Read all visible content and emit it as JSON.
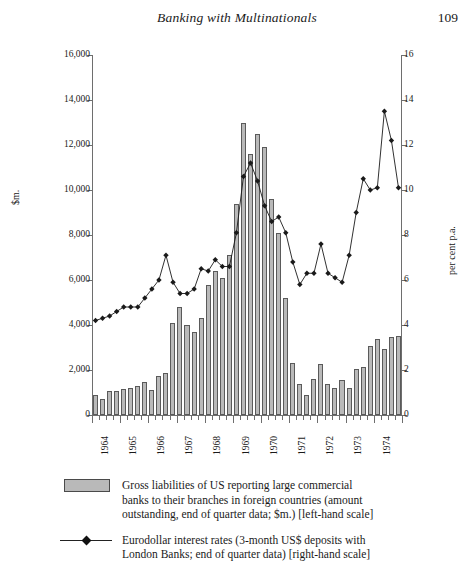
{
  "runhead": {
    "title": "Banking with Multinationals",
    "folio": "109"
  },
  "chart_data": {
    "type": "bar",
    "title": "",
    "xlabel": "",
    "ylabel": "$m.",
    "y2label": "per cent p.a.",
    "ylim": [
      0,
      16000
    ],
    "y2lim": [
      0,
      16
    ],
    "grid": false,
    "legend_position": "below",
    "y_ticks": [
      "0",
      "2,000",
      "4,000",
      "6,000",
      "8,000",
      "10,000",
      "12,000",
      "14,000",
      "16,000"
    ],
    "y_tick_values": [
      0,
      2000,
      4000,
      6000,
      8000,
      10000,
      12000,
      14000,
      16000
    ],
    "y2_ticks": [
      "0",
      "2",
      "4",
      "6",
      "8",
      "10",
      "12",
      "14",
      "16"
    ],
    "y2_tick_values": [
      0,
      2,
      4,
      6,
      8,
      10,
      12,
      14,
      16
    ],
    "x_tick_labels": [
      "1964",
      "1965",
      "1966",
      "1967",
      "1968",
      "1969",
      "1970",
      "1971",
      "1972",
      "1973",
      "1974"
    ],
    "x_periods": [
      "1964Q1",
      "1964Q2",
      "1964Q3",
      "1964Q4",
      "1965Q1",
      "1965Q2",
      "1965Q3",
      "1965Q4",
      "1966Q1",
      "1966Q2",
      "1966Q3",
      "1966Q4",
      "1967Q1",
      "1967Q2",
      "1967Q3",
      "1967Q4",
      "1968Q1",
      "1968Q2",
      "1968Q3",
      "1968Q4",
      "1969Q1",
      "1969Q2",
      "1969Q3",
      "1969Q4",
      "1970Q1",
      "1970Q2",
      "1970Q3",
      "1970Q4",
      "1971Q1",
      "1971Q2",
      "1971Q3",
      "1971Q4",
      "1972Q1",
      "1972Q2",
      "1972Q3",
      "1972Q4",
      "1973Q1",
      "1973Q2",
      "1973Q3",
      "1973Q4",
      "1974Q1",
      "1974Q2",
      "1974Q3",
      "1974Q4"
    ],
    "series": [
      {
        "name": "Gross liabilities of US reporting large commercial banks to their branches in foreign countries (amount outstanding, end of quarter data; $m.) [left-hand scale]",
        "type": "bar",
        "axis": "left",
        "color": "#b9b9b9",
        "values": [
          900,
          700,
          1050,
          1050,
          1150,
          1200,
          1300,
          1450,
          1100,
          1750,
          1850,
          4100,
          4800,
          4000,
          3700,
          4300,
          5800,
          6400,
          6100,
          7100,
          9400,
          13000,
          11600,
          12500,
          11900,
          9600,
          8100,
          5200,
          2300,
          1400,
          900,
          1600,
          2250,
          1400,
          1200,
          1550,
          1200,
          2050,
          2150,
          3050,
          3400,
          2950,
          3450,
          3500
        ]
      },
      {
        "name": "Eurodollar interest rates (3-month US$ deposits with London Banks; end of quarter data) [right-hand scale]",
        "type": "line",
        "axis": "right",
        "color": "#1a1a1a",
        "marker": "diamond",
        "values": [
          4.2,
          4.3,
          4.4,
          4.6,
          4.8,
          4.8,
          4.8,
          5.2,
          5.6,
          6.0,
          7.1,
          5.9,
          5.4,
          5.4,
          5.6,
          6.5,
          6.4,
          6.9,
          6.6,
          6.6,
          8.1,
          10.6,
          11.2,
          10.4,
          9.3,
          8.6,
          8.8,
          8.1,
          6.8,
          5.8,
          6.3,
          6.3,
          7.6,
          6.3,
          6.1,
          5.9,
          7.1,
          9.0,
          10.5,
          10.0,
          10.1,
          13.5,
          12.2,
          10.1
        ]
      }
    ],
    "legend": [
      {
        "marker": "box",
        "lines": [
          "Gross liabilities of US reporting large commercial",
          "banks to their branches in foreign countries (amount",
          "outstanding, end of quarter data; $m.) [left-hand scale]"
        ]
      },
      {
        "marker": "line-diamond",
        "lines": [
          "Eurodollar interest rates (3-month US$ deposits with",
          "London Banks; end of quarter data) [right-hand scale]"
        ]
      }
    ]
  }
}
